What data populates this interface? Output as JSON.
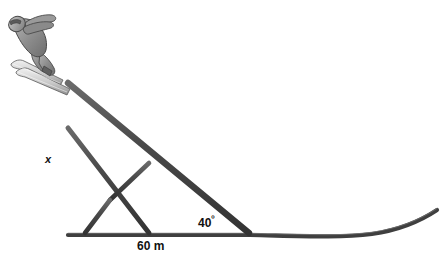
{
  "figure": {
    "colors": {
      "beam": "#4a4a4a",
      "beam_edge": "#3a3a3a",
      "ground": "#3f3f3f",
      "text": "#111111",
      "background": "#ffffff",
      "skier_body": "#8c8c8c",
      "skier_outline": "#4a4a4a",
      "ski": "#d8d8d8"
    },
    "labels": {
      "height": "x",
      "angle": "40",
      "angle_degree_symbol": "º",
      "span": "60 m"
    },
    "geometry": {
      "apex": [
        68,
        83
      ],
      "base_left": [
        68,
        233
      ],
      "base_right": [
        248,
        233
      ],
      "mid_vertical_x": 110,
      "crossing_point": [
        110,
        200
      ],
      "upper_node": [
        148,
        163
      ],
      "left_node": [
        68,
        128
      ],
      "bottom_nodes": [
        [
          68,
          233
        ],
        [
          85,
          233
        ],
        [
          110,
          233
        ],
        [
          148,
          233
        ],
        [
          248,
          233
        ]
      ],
      "slope_angle_degrees": 40,
      "span_meters": 60
    },
    "skier": {
      "name": "ski-jumper",
      "position": [
        4,
        8
      ],
      "size": [
        70,
        78
      ]
    }
  }
}
